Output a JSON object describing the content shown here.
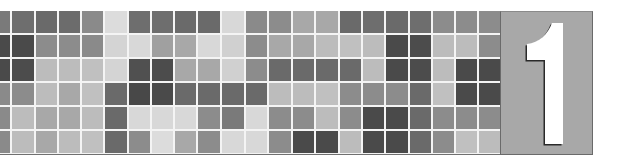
{
  "banner": {
    "number": "1",
    "number_box_color": "#a8a8a8",
    "number_color": "#ffffff",
    "number_shadow_color": "#2a2a2a",
    "grid_line_color": "#f4f4f4",
    "rows": 6,
    "columns": 21,
    "partial_first_column": true,
    "cells": [
      [
        "#7a7a7a",
        "#6e6e6e",
        "#6a6a6a",
        "#6c6c6c",
        "#8a8a8a",
        "#dcdcdc",
        "#6e6e6e",
        "#6e6e6e",
        "#6a6a6a",
        "#6a6a6a",
        "#d8d8d8",
        "#8a8a8a",
        "#8c8c8c",
        "#a8a8a8",
        "#a8a8a8",
        "#6a6a6a",
        "#6e6e6e",
        "#6a6a6a",
        "#6e6e6e",
        "#8c8c8c",
        "#8c8c8c",
        "#8c8c8c"
      ],
      [
        "#4a4a4a",
        "#4a4a4a",
        "#8c8c8c",
        "#8c8c8c",
        "#8a8a8a",
        "#d4d4d4",
        "#d8d8d8",
        "#a0a0a0",
        "#a8a8a8",
        "#d8d8d8",
        "#d0d0d0",
        "#8c8c8c",
        "#a8a8a8",
        "#a8a8a8",
        "#bcbcbc",
        "#c0c0c0",
        "#bcbcbc",
        "#4a4a4a",
        "#4c4c4c",
        "#bcbcbc",
        "#bcbcbc",
        "#8c8c8c"
      ],
      [
        "#4a4a4a",
        "#4c4c4c",
        "#bcbcbc",
        "#bcbcbc",
        "#c0c0c0",
        "#d4d4d4",
        "#505050",
        "#4c4c4c",
        "#a8a8a8",
        "#a8a8a8",
        "#d0d0d0",
        "#8c8c8c",
        "#6a6a6a",
        "#6a6a6a",
        "#6a6a6a",
        "#6a6a6a",
        "#bcbcbc",
        "#4a4a4a",
        "#4c4c4c",
        "#bcbcbc",
        "#4a4a4a",
        "#4a4a4a"
      ],
      [
        "#8a8a8a",
        "#8c8c8c",
        "#bcbcbc",
        "#a8a8a8",
        "#c0c0c0",
        "#6a6a6a",
        "#484848",
        "#4a4a4a",
        "#6a6a6a",
        "#6a6a6a",
        "#6a6a6a",
        "#6a6a6a",
        "#bcbcbc",
        "#bcbcbc",
        "#c0c0c0",
        "#8c8c8c",
        "#8c8c8c",
        "#8c8c8c",
        "#6a6a6a",
        "#c0c0c0",
        "#4a4a4a",
        "#4a4a4a"
      ],
      [
        "#8a8a8a",
        "#bcbcbc",
        "#a8a8a8",
        "#a8a8a8",
        "#bcbcbc",
        "#6a6a6a",
        "#d8d8d8",
        "#d8d8d8",
        "#d8d8d8",
        "#8c8c8c",
        "#7a7a7a",
        "#d8d8d8",
        "#8c8c8c",
        "#8c8c8c",
        "#bcbcbc",
        "#8c8c8c",
        "#4a4a4a",
        "#4a4a4a",
        "#6a6a6a",
        "#8c8c8c",
        "#8c8c8c",
        "#8c8c8c"
      ],
      [
        "#8a8a8a",
        "#bcbcbc",
        "#a8a8a8",
        "#bcbcbc",
        "#c0c0c0",
        "#6a6a6a",
        "#8c8c8c",
        "#dcdcdc",
        "#a8a8a8",
        "#8c8c8c",
        "#d8d8d8",
        "#d8d8d8",
        "#8c8c8c",
        "#4a4a4a",
        "#4a4a4a",
        "#bcbcbc",
        "#4a4a4a",
        "#4a4a4a",
        "#6a6a6a",
        "#8c8c8c",
        "#c0c0c0",
        "#bcbcbc"
      ]
    ]
  }
}
